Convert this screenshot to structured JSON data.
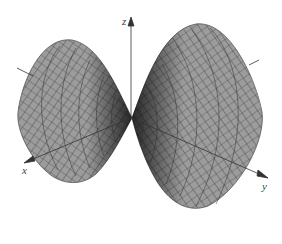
{
  "figure": {
    "title": "",
    "surface": {
      "description": "Double-lobed saddle/cone surface pinched at the origin",
      "fill_color": "#9a9a9a",
      "mesh_color": "#3a3a3a",
      "edge_color": "#555555"
    },
    "axes": {
      "x": {
        "label": "x",
        "color": "#333333"
      },
      "y": {
        "label": "y",
        "color": "#333333"
      },
      "z": {
        "label": "z",
        "color": "#333333"
      }
    }
  }
}
